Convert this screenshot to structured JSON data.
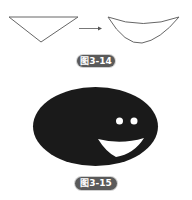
{
  "figures": [
    {
      "label": "图3-14",
      "description": "Triangle transformed into curved shape",
      "before_shape": "inverted-triangle",
      "after_shape": "curved-crescent",
      "arrow": "right-arrow"
    },
    {
      "label": "图3-15",
      "description": "Dark ellipse smiley face with two white eyes and a white smiling mouth",
      "shape": "ellipse-face"
    }
  ],
  "colors": {
    "stroke": "#555555",
    "face_fill": "#1a1a1a",
    "label_bg": "#5a5a5a",
    "label_text": "#ffffff",
    "feature_fill": "#ffffff"
  }
}
